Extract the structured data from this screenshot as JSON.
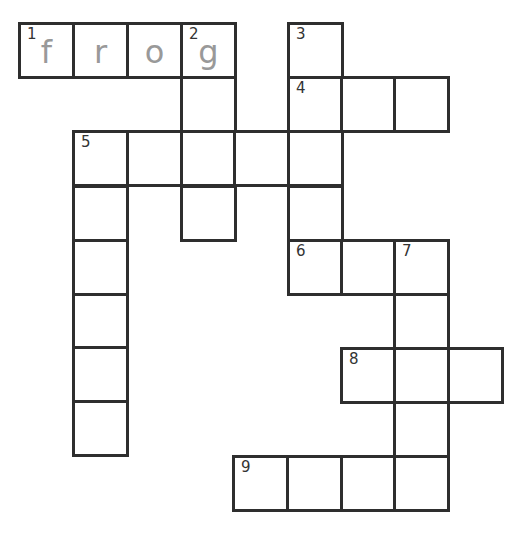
{
  "puzzle": {
    "type": "crossword",
    "cell_size": 54,
    "colors": {
      "border": "#2e2e2e",
      "number": "#333333",
      "letter": "#999999",
      "background": "#ffffff"
    },
    "cells": [
      {
        "x": 18,
        "y": 22,
        "number": "1",
        "letter": "f"
      },
      {
        "x": 72,
        "y": 22,
        "number": "",
        "letter": "r"
      },
      {
        "x": 126,
        "y": 22,
        "number": "",
        "letter": "o"
      },
      {
        "x": 180,
        "y": 22,
        "number": "2",
        "letter": "g"
      },
      {
        "x": 287,
        "y": 22,
        "number": "3",
        "letter": ""
      },
      {
        "x": 180,
        "y": 76,
        "number": "",
        "letter": ""
      },
      {
        "x": 287,
        "y": 76,
        "number": "4",
        "letter": ""
      },
      {
        "x": 340,
        "y": 76,
        "number": "",
        "letter": ""
      },
      {
        "x": 393,
        "y": 76,
        "number": "",
        "letter": ""
      },
      {
        "x": 72,
        "y": 130,
        "number": "5",
        "letter": ""
      },
      {
        "x": 126,
        "y": 130,
        "number": "",
        "letter": ""
      },
      {
        "x": 180,
        "y": 130,
        "number": "",
        "letter": ""
      },
      {
        "x": 233,
        "y": 130,
        "number": "",
        "letter": ""
      },
      {
        "x": 287,
        "y": 130,
        "number": "",
        "letter": ""
      },
      {
        "x": 72,
        "y": 185,
        "number": "",
        "letter": ""
      },
      {
        "x": 180,
        "y": 185,
        "number": "",
        "letter": ""
      },
      {
        "x": 287,
        "y": 185,
        "number": "",
        "letter": ""
      },
      {
        "x": 72,
        "y": 239,
        "number": "",
        "letter": ""
      },
      {
        "x": 287,
        "y": 239,
        "number": "6",
        "letter": ""
      },
      {
        "x": 340,
        "y": 239,
        "number": "",
        "letter": ""
      },
      {
        "x": 393,
        "y": 239,
        "number": "7",
        "letter": ""
      },
      {
        "x": 72,
        "y": 293,
        "number": "",
        "letter": ""
      },
      {
        "x": 393,
        "y": 293,
        "number": "",
        "letter": ""
      },
      {
        "x": 72,
        "y": 346,
        "number": "",
        "letter": ""
      },
      {
        "x": 340,
        "y": 347,
        "number": "8",
        "letter": ""
      },
      {
        "x": 393,
        "y": 347,
        "number": "",
        "letter": ""
      },
      {
        "x": 447,
        "y": 347,
        "number": "",
        "letter": ""
      },
      {
        "x": 72,
        "y": 400,
        "number": "",
        "letter": ""
      },
      {
        "x": 393,
        "y": 401,
        "number": "",
        "letter": ""
      },
      {
        "x": 232,
        "y": 455,
        "number": "9",
        "letter": ""
      },
      {
        "x": 286,
        "y": 455,
        "number": "",
        "letter": ""
      },
      {
        "x": 340,
        "y": 455,
        "number": "",
        "letter": ""
      },
      {
        "x": 393,
        "y": 455,
        "number": "",
        "letter": ""
      }
    ],
    "entries": {
      "across": [
        {
          "number": "1",
          "length": 4,
          "answer": "frog"
        },
        {
          "number": "4",
          "length": 3
        },
        {
          "number": "5",
          "length": 5
        },
        {
          "number": "6",
          "length": 3
        },
        {
          "number": "8",
          "length": 3
        },
        {
          "number": "9",
          "length": 4
        }
      ],
      "down": [
        {
          "number": "2",
          "length": 4
        },
        {
          "number": "3",
          "length": 5
        },
        {
          "number": "5",
          "length": 6
        },
        {
          "number": "7",
          "length": 5
        }
      ]
    }
  }
}
